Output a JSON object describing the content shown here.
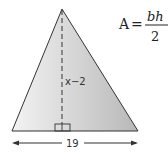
{
  "diagram": {
    "shape": "triangle",
    "height_label": "x−2",
    "base_label": "19",
    "formula": {
      "lhs": "A",
      "equals": "=",
      "numerator": "bh",
      "denominator": "2"
    },
    "colors": {
      "fill_light": "#f2f2f2",
      "fill_dark": "#bdbdbd",
      "stroke": "#333333"
    }
  }
}
